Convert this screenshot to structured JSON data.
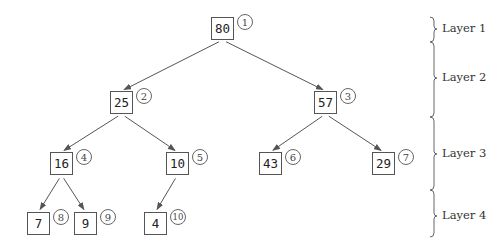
{
  "diagram": {
    "type": "binary-heap-tree",
    "nodes": [
      {
        "index": "1",
        "value": "80",
        "x": 211,
        "y": 17,
        "layer": 1
      },
      {
        "index": "2",
        "value": "25",
        "x": 110,
        "y": 91,
        "layer": 2
      },
      {
        "index": "3",
        "value": "57",
        "x": 314,
        "y": 91,
        "layer": 2
      },
      {
        "index": "4",
        "value": "16",
        "x": 50,
        "y": 152,
        "layer": 3
      },
      {
        "index": "5",
        "value": "10",
        "x": 166,
        "y": 152,
        "layer": 3
      },
      {
        "index": "6",
        "value": "43",
        "x": 259,
        "y": 152,
        "layer": 3
      },
      {
        "index": "7",
        "value": "29",
        "x": 372,
        "y": 152,
        "layer": 3
      },
      {
        "index": "8",
        "value": "7",
        "x": 27,
        "y": 212,
        "layer": 4
      },
      {
        "index": "9",
        "value": "9",
        "x": 74,
        "y": 212,
        "layer": 4
      },
      {
        "index": "10",
        "value": "4",
        "x": 144,
        "y": 212,
        "layer": 4
      }
    ],
    "edges": [
      {
        "from": "1",
        "to": "2"
      },
      {
        "from": "1",
        "to": "3"
      },
      {
        "from": "2",
        "to": "4"
      },
      {
        "from": "2",
        "to": "5"
      },
      {
        "from": "3",
        "to": "6"
      },
      {
        "from": "3",
        "to": "7"
      },
      {
        "from": "4",
        "to": "8"
      },
      {
        "from": "4",
        "to": "9"
      },
      {
        "from": "5",
        "to": "10"
      }
    ],
    "layers": [
      {
        "label": "Layer 1",
        "top": 17,
        "bottom": 42,
        "tip": 29
      },
      {
        "label": "Layer 2",
        "top": 42,
        "bottom": 117,
        "tip": 78
      },
      {
        "label": "Layer 3",
        "top": 117,
        "bottom": 190,
        "tip": 154
      },
      {
        "label": "Layer 4",
        "top": 190,
        "bottom": 237,
        "tip": 216
      }
    ],
    "colors": {
      "line": "#555555",
      "text": "#222222",
      "brace": "#666666"
    }
  }
}
